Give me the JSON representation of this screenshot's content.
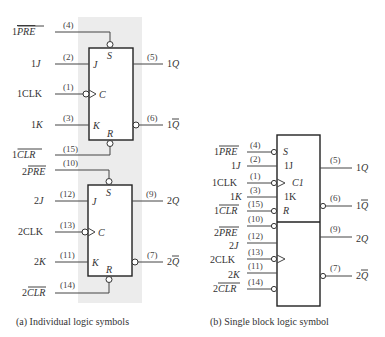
{
  "panel_a": {
    "caption": "(a)  Individual logic symbols",
    "background_color": "#ececec",
    "ff1": {
      "inputs": [
        {
          "label_prefix": "1",
          "label": "PRE",
          "overbar": true,
          "pin": "(4)",
          "inner": "S"
        },
        {
          "label_prefix": "1",
          "label": "J",
          "overbar": false,
          "pin": "(2)",
          "inner": "J"
        },
        {
          "label_prefix": "1",
          "label": "CLK",
          "overbar": false,
          "pin": "(1)",
          "inner": "C"
        },
        {
          "label_prefix": "1",
          "label": "K",
          "overbar": false,
          "pin": "(3)",
          "inner": "K"
        },
        {
          "label_prefix": "1",
          "label": "CLR",
          "overbar": true,
          "pin": "(15)",
          "inner": "R"
        }
      ],
      "outputs": [
        {
          "label_prefix": "1",
          "label": "Q",
          "overbar": false,
          "pin": "(5)"
        },
        {
          "label_prefix": "1",
          "label": "Q",
          "overbar": true,
          "pin": "(6)"
        }
      ]
    },
    "ff2": {
      "inputs": [
        {
          "label_prefix": "2",
          "label": "PRE",
          "overbar": true,
          "pin": "(10)",
          "inner": "S"
        },
        {
          "label_prefix": "2",
          "label": "J",
          "overbar": false,
          "pin": "(12)",
          "inner": "J"
        },
        {
          "label_prefix": "2",
          "label": "CLK",
          "overbar": false,
          "pin": "(13)",
          "inner": "C"
        },
        {
          "label_prefix": "2",
          "label": "K",
          "overbar": false,
          "pin": "(11)",
          "inner": "K"
        },
        {
          "label_prefix": "2",
          "label": "CLR",
          "overbar": true,
          "pin": "(14)",
          "inner": "R"
        }
      ],
      "outputs": [
        {
          "label_prefix": "2",
          "label": "Q",
          "overbar": false,
          "pin": "(9)"
        },
        {
          "label_prefix": "2",
          "label": "Q",
          "overbar": true,
          "pin": "(7)"
        }
      ]
    }
  },
  "panel_b": {
    "caption": "(b)  Single block logic symbol",
    "inner_labels": {
      "s": "S",
      "j": "1J",
      "c": "C1",
      "k": "1K",
      "r": "R"
    },
    "inputs": [
      {
        "label_prefix": "1",
        "label": "PRE",
        "pin": "(4)"
      },
      {
        "label_prefix": "1",
        "label": "J",
        "pin": "(2)"
      },
      {
        "label_prefix": "1",
        "label": "CLK",
        "pin": "(1)"
      },
      {
        "label_prefix": "1",
        "label": "K",
        "pin": "(3)"
      },
      {
        "label_prefix": "1",
        "label": "CLR",
        "pin": "(15)"
      },
      {
        "label_prefix": "2",
        "label": "PRE",
        "pin": "(10)"
      },
      {
        "label_prefix": "2",
        "label": "J",
        "pin": "(12)"
      },
      {
        "label_prefix": "2",
        "label": "CLK",
        "pin": "(13)"
      },
      {
        "label_prefix": "2",
        "label": "K",
        "pin": "(11)"
      },
      {
        "label_prefix": "2",
        "label": "CLR",
        "pin": "(14)"
      }
    ],
    "outputs": [
      {
        "label_prefix": "1",
        "label": "Q",
        "pin": "(5)"
      },
      {
        "label_prefix": "1",
        "label": "Q",
        "pin": "(6)"
      },
      {
        "label_prefix": "2",
        "label": "Q",
        "pin": "(9)"
      },
      {
        "label_prefix": "2",
        "label": "Q",
        "pin": "(7)"
      }
    ]
  }
}
